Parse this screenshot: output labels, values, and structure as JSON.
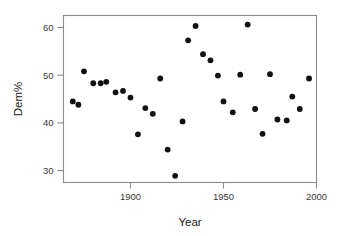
{
  "chart_data": {
    "type": "scatter",
    "title": "",
    "xlabel": "Year",
    "ylabel": "Dem%",
    "xlim": [
      1864,
      2000
    ],
    "ylim": [
      27.5,
      62.5
    ],
    "xticks": [
      1900,
      1950,
      2000
    ],
    "xticklabels": [
      "1900",
      "1950",
      "2000"
    ],
    "yticks": [
      30,
      40,
      50,
      60
    ],
    "yticklabels": [
      "30",
      "40",
      "50",
      "60"
    ],
    "grid": false,
    "legend": null,
    "marker": "filled-circle",
    "marker_color": "#111111",
    "frame_color": "#8c8c8c",
    "x": [
      1869,
      1872,
      1875,
      1880,
      1884,
      1887,
      1892,
      1896,
      1900,
      1904,
      1908,
      1912,
      1916,
      1920,
      1924,
      1928,
      1931,
      1935,
      1939,
      1943,
      1947,
      1950,
      1955,
      1959,
      1963,
      1967,
      1971,
      1975,
      1979,
      1984,
      1987,
      1991,
      1996
    ],
    "y": [
      44.5,
      43.8,
      50.8,
      48.3,
      48.3,
      48.6,
      46.4,
      46.7,
      45.3,
      37.6,
      43.1,
      41.9,
      49.3,
      34.4,
      28.9,
      40.3,
      57.3,
      60.3,
      54.4,
      53.1,
      49.9,
      44.5,
      42.2,
      50.1,
      60.6,
      42.9,
      37.7,
      50.2,
      40.7,
      40.5,
      45.5,
      42.9,
      49.3
    ],
    "points": [
      {
        "x": 1869,
        "y": 44.5
      },
      {
        "x": 1872,
        "y": 43.8
      },
      {
        "x": 1875,
        "y": 50.8
      },
      {
        "x": 1880,
        "y": 48.3
      },
      {
        "x": 1884,
        "y": 48.3
      },
      {
        "x": 1887,
        "y": 48.6
      },
      {
        "x": 1892,
        "y": 46.4
      },
      {
        "x": 1896,
        "y": 46.7
      },
      {
        "x": 1900,
        "y": 45.3
      },
      {
        "x": 1904,
        "y": 37.6
      },
      {
        "x": 1908,
        "y": 43.1
      },
      {
        "x": 1912,
        "y": 41.9
      },
      {
        "x": 1916,
        "y": 49.3
      },
      {
        "x": 1920,
        "y": 34.4
      },
      {
        "x": 1924,
        "y": 28.9
      },
      {
        "x": 1928,
        "y": 40.3
      },
      {
        "x": 1931,
        "y": 57.3
      },
      {
        "x": 1935,
        "y": 60.3
      },
      {
        "x": 1939,
        "y": 54.4
      },
      {
        "x": 1943,
        "y": 53.1
      },
      {
        "x": 1947,
        "y": 49.9
      },
      {
        "x": 1950,
        "y": 44.5
      },
      {
        "x": 1955,
        "y": 42.2
      },
      {
        "x": 1959,
        "y": 50.1
      },
      {
        "x": 1963,
        "y": 60.6
      },
      {
        "x": 1967,
        "y": 42.9
      },
      {
        "x": 1971,
        "y": 37.7
      },
      {
        "x": 1975,
        "y": 50.2
      },
      {
        "x": 1979,
        "y": 40.7
      },
      {
        "x": 1984,
        "y": 40.5
      },
      {
        "x": 1987,
        "y": 45.5
      },
      {
        "x": 1991,
        "y": 42.9
      },
      {
        "x": 1996,
        "y": 49.3
      }
    ]
  }
}
